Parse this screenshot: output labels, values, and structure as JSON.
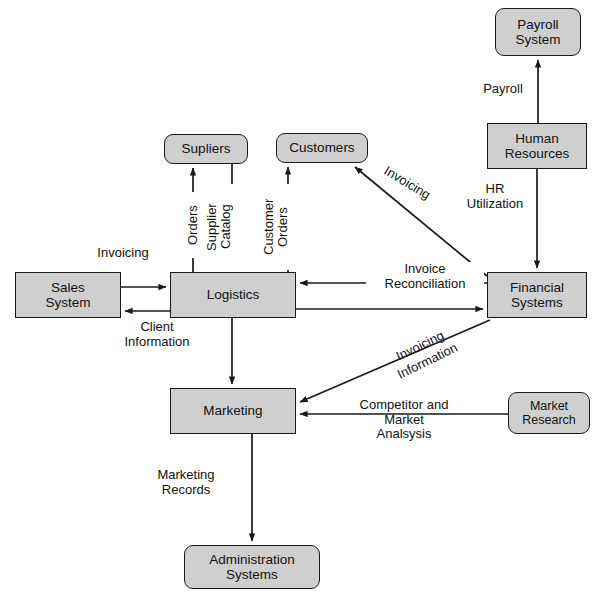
{
  "diagram": {
    "background_color": "#ffffff",
    "node_fill": "#cfcfcf",
    "node_stroke": "#1a1a1a",
    "nodes": [
      {
        "id": "payroll_system",
        "label": "Payroll\nSystem",
        "line1": "Payroll",
        "line2": "System",
        "shape": "rounded",
        "x": 495,
        "y": 8,
        "w": 86,
        "h": 48
      },
      {
        "id": "human_resources",
        "label": "Human\nResources",
        "line1": "Human",
        "line2": "Resources",
        "shape": "rect",
        "x": 487,
        "y": 123,
        "w": 100,
        "h": 46
      },
      {
        "id": "financial_systems",
        "label": "Financial\nSystems",
        "line1": "Financial",
        "line2": "Systems",
        "shape": "rect",
        "x": 487,
        "y": 272,
        "w": 100,
        "h": 46
      },
      {
        "id": "supliers",
        "label": "Supliers",
        "line1": "Supliers",
        "line2": "",
        "shape": "rounded",
        "x": 164,
        "y": 134,
        "w": 84,
        "h": 30
      },
      {
        "id": "customers",
        "label": "Customers",
        "line1": "Customers",
        "line2": "",
        "shape": "rounded",
        "x": 276,
        "y": 133,
        "w": 92,
        "h": 30
      },
      {
        "id": "sales_system",
        "label": "Sales\nSystem",
        "line1": "Sales",
        "line2": "System",
        "shape": "rect",
        "x": 15,
        "y": 272,
        "w": 106,
        "h": 46
      },
      {
        "id": "logistics",
        "label": "Logistics",
        "line1": "Logistics",
        "line2": "",
        "shape": "rect",
        "x": 170,
        "y": 272,
        "w": 126,
        "h": 46
      },
      {
        "id": "marketing",
        "label": "Marketing",
        "line1": "Marketing",
        "line2": "",
        "shape": "rect",
        "x": 170,
        "y": 388,
        "w": 126,
        "h": 46
      },
      {
        "id": "market_research",
        "label": "Market\nResearch",
        "line1": "Market",
        "line2": "Research",
        "shape": "rounded",
        "x": 508,
        "y": 392,
        "w": 82,
        "h": 42
      },
      {
        "id": "administration",
        "label": "Administration\nSystems",
        "line1": "Administration",
        "line2": "Systems",
        "shape": "rounded",
        "x": 184,
        "y": 545,
        "w": 136,
        "h": 44
      }
    ],
    "edges": [
      {
        "id": "hr-to-payroll",
        "from": "human_resources",
        "to": "payroll_system",
        "label": "Payroll",
        "arrow": "single"
      },
      {
        "id": "hr-to-financial",
        "from": "human_resources",
        "to": "financial_systems",
        "label": "HR\nUtilization",
        "arrow": "single"
      },
      {
        "id": "logistics-to-supliers",
        "from": "logistics",
        "to": "supliers",
        "label": "Orders",
        "arrow": "single"
      },
      {
        "id": "supliers-to-logistics",
        "from": "supliers",
        "to": "logistics",
        "label": "Supplier\nCatalog",
        "arrow": "single"
      },
      {
        "id": "logistics-to-customers",
        "from": "logistics",
        "to": "customers",
        "label": "Customer\nOrders",
        "arrow": "single"
      },
      {
        "id": "financial-to-customers",
        "from": "financial_systems",
        "to": "customers",
        "label": "Invoicing",
        "arrow": "single"
      },
      {
        "id": "sales-to-logistics",
        "from": "sales_system",
        "to": "logistics",
        "label": "Invoicing",
        "arrow": "single"
      },
      {
        "id": "logistics-to-sales",
        "from": "logistics",
        "to": "sales_system",
        "label": "Client\nInformation",
        "arrow": "single"
      },
      {
        "id": "financial-to-logistics",
        "from": "financial_systems",
        "to": "logistics",
        "label": "Invoice\nReconciliation",
        "arrow": "single"
      },
      {
        "id": "logistics-to-financial",
        "from": "logistics",
        "to": "financial_systems",
        "label": "",
        "arrow": "single"
      },
      {
        "id": "logistics-to-marketing",
        "from": "logistics",
        "to": "marketing",
        "label": "",
        "arrow": "single"
      },
      {
        "id": "financial-to-marketing",
        "from": "financial_systems",
        "to": "marketing",
        "label": "Invoicing\nInformation",
        "arrow": "single"
      },
      {
        "id": "research-to-marketing",
        "from": "market_research",
        "to": "marketing",
        "label": "Competitor and\nMarket\nAnalsysis",
        "arrow": "single"
      },
      {
        "id": "marketing-to-administration",
        "from": "marketing",
        "to": "administration",
        "label": "Marketing\nRecords",
        "arrow": "single"
      }
    ],
    "labels": {
      "payroll": "Payroll",
      "hr_utilization_line1": "HR",
      "hr_utilization_line2": "Utilization",
      "orders": "Orders",
      "supplier_catalog_line1": "Supplier",
      "supplier_catalog_line2": "Catalog",
      "customer_line1": "Customer",
      "customer_line2": "Orders",
      "invoicing_diag": "Invoicing",
      "invoicing_sales": "Invoicing",
      "client_info_line1": "Client",
      "client_info_line2": "Information",
      "invoice_recon_line1": "Invoice",
      "invoice_recon_line2": "Reconciliation",
      "invoicing_info_line1": "Invoicing",
      "invoicing_info_line2": "Information",
      "competitor_line1": "Competitor and",
      "competitor_line2": "Market",
      "competitor_line3": "Analsysis",
      "marketing_records_line1": "Marketing",
      "marketing_records_line2": "Records"
    }
  }
}
